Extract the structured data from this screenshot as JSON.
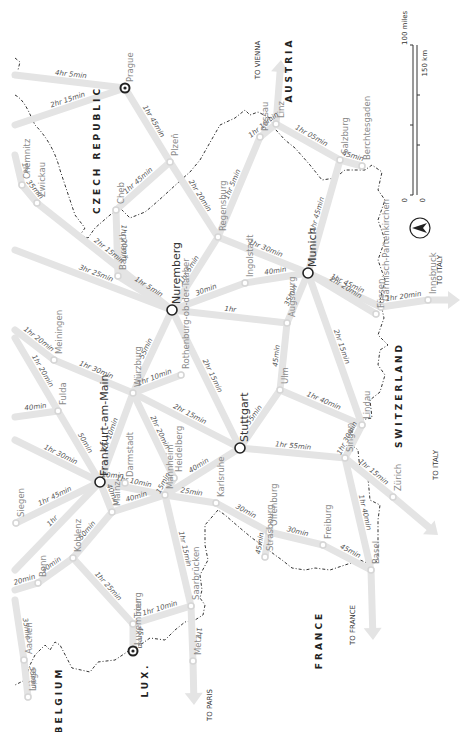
{
  "map": {
    "description": "Rail travel times map of Germany and neighbours (rotated 90°)",
    "countries": [
      {
        "id": "czech",
        "label": "CZECH REPUBLIC",
        "x": 100,
        "y": 150
      },
      {
        "id": "austria",
        "label": "AUSTRIA",
        "x": 292,
        "y": 70
      },
      {
        "id": "switzerland",
        "label": "SWITZERLAND",
        "x": 402,
        "y": 395
      },
      {
        "id": "france",
        "label": "FRANCE",
        "x": 322,
        "y": 640
      },
      {
        "id": "belgium",
        "label": "BELGIUM",
        "x": 62,
        "y": 700
      },
      {
        "id": "lux",
        "label": "LUX.",
        "x": 148,
        "y": 680
      }
    ],
    "directions": [
      {
        "id": "to-vienna",
        "label": "TO VIENNA",
        "x": 260,
        "y": 60
      },
      {
        "id": "to-italy-1",
        "label": "TO ITALY",
        "x": 442,
        "y": 270
      },
      {
        "id": "to-italy-2",
        "label": "TO ITALY",
        "x": 438,
        "y": 465
      },
      {
        "id": "to-france",
        "label": "TO FRANCE",
        "x": 355,
        "y": 625
      },
      {
        "id": "to-paris",
        "label": "TO PARIS",
        "x": 212,
        "y": 705
      }
    ],
    "cities": [
      {
        "id": "prague",
        "label": "Prague",
        "x": 125,
        "y": 88,
        "type": "capital"
      },
      {
        "id": "plzen",
        "label": "Plzeň",
        "x": 170,
        "y": 162,
        "type": "minor"
      },
      {
        "id": "regensburg",
        "label": "Regensburg",
        "x": 218,
        "y": 237,
        "type": "minor"
      },
      {
        "id": "passau",
        "label": "Passau",
        "x": 260,
        "y": 137,
        "type": "minor"
      },
      {
        "id": "linz",
        "label": "Linz",
        "x": 276,
        "y": 124,
        "type": "minor"
      },
      {
        "id": "salzburg",
        "label": "Salzburg",
        "x": 340,
        "y": 160,
        "type": "minor"
      },
      {
        "id": "berchtesgaden",
        "label": "Berchtesgaden",
        "x": 362,
        "y": 166,
        "type": "minor"
      },
      {
        "id": "munich",
        "label": "Munich",
        "x": 308,
        "y": 273,
        "type": "major"
      },
      {
        "id": "ingolstadt",
        "label": "Ingolstadt",
        "x": 245,
        "y": 283,
        "type": "minor"
      },
      {
        "id": "nuremberg",
        "label": "Nuremberg",
        "x": 172,
        "y": 310,
        "type": "major"
      },
      {
        "id": "bayreuth",
        "label": "Bayreuth",
        "x": 118,
        "y": 276,
        "type": "minor"
      },
      {
        "id": "cheb",
        "label": "Cheb",
        "x": 116,
        "y": 210,
        "type": "minor"
      },
      {
        "id": "chemnitz",
        "label": "Chemnitz",
        "x": 22,
        "y": 185,
        "type": "minor"
      },
      {
        "id": "zwickau",
        "label": "Zwickau",
        "x": 37,
        "y": 203,
        "type": "minor"
      },
      {
        "id": "augsburg",
        "label": "Augsburg",
        "x": 287,
        "y": 323,
        "type": "minor"
      },
      {
        "id": "ulm",
        "label": "Ulm",
        "x": 280,
        "y": 390,
        "type": "minor"
      },
      {
        "id": "stuttgart",
        "label": "Stuttgart",
        "x": 240,
        "y": 448,
        "type": "major"
      },
      {
        "id": "rothenburg",
        "label": "Rothenburg-ob-der-Tauber",
        "x": 181,
        "y": 375,
        "type": "minor"
      },
      {
        "id": "wurzburg",
        "label": "Würzburg",
        "x": 133,
        "y": 393,
        "type": "minor"
      },
      {
        "id": "meiningen",
        "label": "Meiningen",
        "x": 54,
        "y": 360,
        "type": "minor"
      },
      {
        "id": "fulda",
        "label": "Fulda",
        "x": 58,
        "y": 411,
        "type": "minor"
      },
      {
        "id": "frankfurt",
        "label": "Frankfurt-am-Main",
        "x": 100,
        "y": 482,
        "type": "major"
      },
      {
        "id": "darmstadt",
        "label": "Darmstadt",
        "x": 125,
        "y": 483,
        "type": "minor"
      },
      {
        "id": "heidelberg",
        "label": "Heidelberg",
        "x": 174,
        "y": 478,
        "type": "minor"
      },
      {
        "id": "mannheim",
        "label": "Mannheim",
        "x": 165,
        "y": 495,
        "type": "minor"
      },
      {
        "id": "karlsruhe",
        "label": "Karlsruhe",
        "x": 216,
        "y": 503,
        "type": "minor"
      },
      {
        "id": "mainz",
        "label": "Mainz",
        "x": 112,
        "y": 512,
        "type": "minor"
      },
      {
        "id": "koblenz",
        "label": "Koblenz",
        "x": 73,
        "y": 558,
        "type": "minor"
      },
      {
        "id": "bonn",
        "label": "Bonn",
        "x": 38,
        "y": 583,
        "type": "minor"
      },
      {
        "id": "siegen",
        "label": "Siegen",
        "x": 16,
        "y": 523,
        "type": "minor"
      },
      {
        "id": "aachen",
        "label": "Aachen",
        "x": 24,
        "y": 660,
        "type": "minor"
      },
      {
        "id": "liege",
        "label": "Liège",
        "x": 28,
        "y": 697,
        "type": "minor"
      },
      {
        "id": "trier",
        "label": "Trier",
        "x": 133,
        "y": 624,
        "type": "minor"
      },
      {
        "id": "luxembourg",
        "label": "Luxembourg",
        "x": 133,
        "y": 651,
        "type": "capital"
      },
      {
        "id": "saarbrucken",
        "label": "Saarbrücken",
        "x": 191,
        "y": 606,
        "type": "minor"
      },
      {
        "id": "metz",
        "label": "Metz",
        "x": 193,
        "y": 661,
        "type": "minor"
      },
      {
        "id": "offenburg",
        "label": "Offenburg",
        "x": 269,
        "y": 532,
        "type": "minor"
      },
      {
        "id": "strasbourg",
        "label": "Strasbourg",
        "x": 265,
        "y": 557,
        "type": "minor"
      },
      {
        "id": "freiburg",
        "label": "Freiburg",
        "x": 323,
        "y": 545,
        "type": "minor"
      },
      {
        "id": "basel",
        "label": "Basel",
        "x": 371,
        "y": 570,
        "type": "minor"
      },
      {
        "id": "singen",
        "label": "Singen",
        "x": 345,
        "y": 458,
        "type": "minor"
      },
      {
        "id": "lindau",
        "label": "Lindau",
        "x": 362,
        "y": 425,
        "type": "minor"
      },
      {
        "id": "zurich",
        "label": "Zürich",
        "x": 393,
        "y": 497,
        "type": "minor"
      },
      {
        "id": "fussen",
        "label": "Füssen",
        "x": 376,
        "y": 314,
        "type": "minor"
      },
      {
        "id": "garmisch",
        "label": "Garmisch-Partenkirchen",
        "x": 381,
        "y": 307,
        "type": "minor"
      },
      {
        "id": "innsbruck",
        "label": "Innsbruck",
        "x": 428,
        "y": 300,
        "type": "minor"
      }
    ],
    "routes": [
      {
        "from": [
          15,
          75
        ],
        "to": "prague",
        "time": "4hr 5min"
      },
      {
        "from": [
          15,
          125
        ],
        "to": "prague",
        "time": "2hr 15min"
      },
      {
        "from": "prague",
        "to": "plzen",
        "time": "1hr 45min"
      },
      {
        "from": "plzen",
        "to": "regensburg",
        "time": "2hr 20min"
      },
      {
        "from": "plzen",
        "to": "cheb",
        "time": "1hr 45min"
      },
      {
        "from": "regensburg",
        "to": "passau",
        "time": "1hr 5min"
      },
      {
        "from": "passau",
        "to": "linz",
        "time": "1hr 10min"
      },
      {
        "from": "linz",
        "to": "salzburg",
        "time": "1hr 05min"
      },
      {
        "from": "salzburg",
        "to": "berchtesgaden",
        "time": "45min"
      },
      {
        "from": "salzburg",
        "to": "munich",
        "time": "1hr 45min"
      },
      {
        "from": "regensburg",
        "to": "nuremberg",
        "time": "1hr 5min"
      },
      {
        "from": "regensburg",
        "to": "munich",
        "time": "1hr 30min"
      },
      {
        "from": "cheb",
        "to": "bayreuth",
        "time": "1hr 20min"
      },
      {
        "from": "bayreuth",
        "to": "nuremberg",
        "time": "1hr 5min"
      },
      {
        "from": [
          15,
          155
        ],
        "to": "chemnitz",
        "time": "1hr"
      },
      {
        "from": "chemnitz",
        "to": "zwickau",
        "time": "35min"
      },
      {
        "from": "zwickau",
        "to": "nuremberg",
        "time": "2hr 15min"
      },
      {
        "from": [
          15,
          250
        ],
        "to": "nuremberg",
        "time": "3hr 25min"
      },
      {
        "from": "nuremberg",
        "to": "ingolstadt",
        "time": "30min"
      },
      {
        "from": "ingolstadt",
        "to": "munich",
        "time": "40min"
      },
      {
        "from": "nuremberg",
        "to": "augsburg",
        "time": "1hr"
      },
      {
        "from": "augsburg",
        "to": "munich",
        "time": "35min"
      },
      {
        "from": "munich",
        "to": "garmisch",
        "time": "1hr 45min"
      },
      {
        "from": "munich",
        "to": "fussen",
        "time": "2hr 20min"
      },
      {
        "from": "garmisch",
        "to": "innsbruck",
        "time": "1hr 20min"
      },
      {
        "from": "munich",
        "to": "lindau",
        "time": "2hr 15min"
      },
      {
        "from": "augsburg",
        "to": "ulm",
        "time": "45min"
      },
      {
        "from": "ulm",
        "to": "stuttgart",
        "time": "55min"
      },
      {
        "from": "ulm",
        "to": "lindau",
        "time": "1hr 40min"
      },
      {
        "from": "nuremberg",
        "to": "wurzburg",
        "time": "55min"
      },
      {
        "from": "nuremberg",
        "to": "stuttgart",
        "time": "2hr 15min"
      },
      {
        "from": "wurzburg",
        "to": "rothenburg",
        "time": "1hr 10min"
      },
      {
        "from": "wurzburg",
        "to": "meiningen",
        "time": "1hr 30min"
      },
      {
        "from": [
          15,
          330
        ],
        "to": "meiningen",
        "time": "1hr 20min"
      },
      {
        "from": [
          15,
          338
        ],
        "to": "fulda",
        "time": "1hr 20min"
      },
      {
        "from": [
          15,
          417
        ],
        "to": "fulda",
        "time": "40min"
      },
      {
        "from": "fulda",
        "to": "frankfurt",
        "time": "50min"
      },
      {
        "from": [
          15,
          440
        ],
        "to": "frankfurt",
        "time": "1hr 30min"
      },
      {
        "from": "wurzburg",
        "to": "frankfurt",
        "time": "1hr 10min"
      },
      {
        "from": "wurzburg",
        "to": "stuttgart",
        "time": "2hr 15min"
      },
      {
        "from": "wurzburg",
        "to": "heidelberg",
        "time": "2hr 20min"
      },
      {
        "from": "frankfurt",
        "to": "mannheim",
        "time": "1hr 10min"
      },
      {
        "from": "frankfurt",
        "to": "darmstadt",
        "time": "20min"
      },
      {
        "from": "frankfurt",
        "to": "mainz",
        "time": "40min"
      },
      {
        "from": "mainz",
        "to": "mannheim",
        "time": "40min"
      },
      {
        "from": "mannheim",
        "to": "heidelberg",
        "time": "15min"
      },
      {
        "from": "mannheim",
        "to": "stuttgart",
        "time": "40min"
      },
      {
        "from": "mannheim",
        "to": "karlsruhe",
        "time": "25min"
      },
      {
        "from": "mannheim",
        "to": "saarbrucken",
        "time": "1hr 15min"
      },
      {
        "from": "karlsruhe",
        "to": "offenburg",
        "time": "30min"
      },
      {
        "from": "stuttgart",
        "to": "singen",
        "time": "1hr 55min"
      },
      {
        "from": "frankfurt",
        "to": "siegen",
        "time": "1hr 45min"
      },
      {
        "from": "frankfurt",
        "to": [
          15,
          570
        ],
        "time": "1hr"
      },
      {
        "from": "mainz",
        "to": "koblenz",
        "time": "50min"
      },
      {
        "from": "koblenz",
        "to": "bonn",
        "time": "30min"
      },
      {
        "from": "bonn",
        "to": [
          15,
          590
        ],
        "time": "20min"
      },
      {
        "from": "koblenz",
        "to": "trier",
        "time": "1hr 25min"
      },
      {
        "from": "trier",
        "to": "luxembourg",
        "time": "45min"
      },
      {
        "from": "trier",
        "to": "saarbrucken",
        "time": "1hr 10min"
      },
      {
        "from": "saarbrucken",
        "to": "metz",
        "time": "1hr"
      },
      {
        "from": [
          15,
          600
        ],
        "to": "aachen",
        "time": "35min"
      },
      {
        "from": "aachen",
        "to": "liege",
        "time": "55min"
      },
      {
        "from": "offenburg",
        "to": "strasbourg",
        "time": "45min"
      },
      {
        "from": "offenburg",
        "to": "freiburg",
        "time": "30min"
      },
      {
        "from": "freiburg",
        "to": "basel",
        "time": "45min"
      },
      {
        "from": "basel",
        "to": "singen",
        "time": "1hr 40min"
      },
      {
        "from": "singen",
        "to": "lindau",
        "time": "1hr 30min"
      },
      {
        "from": "singen",
        "to": "zurich",
        "time": "1hr 15min"
      }
    ],
    "arrows": [
      {
        "id": "vienna-arrow",
        "from": "linz",
        "tip": [
          281,
          60
        ]
      },
      {
        "id": "italy-arrow-1",
        "from": "innsbruck",
        "tip": [
          460,
          300
        ]
      },
      {
        "id": "italy-arrow-2",
        "from": "zurich",
        "tip": [
          438,
          535
        ]
      },
      {
        "id": "france-arrow",
        "from": "basel",
        "tip": [
          373,
          640
        ]
      },
      {
        "id": "paris-arrow",
        "from": "metz",
        "tip": [
          194,
          705
        ]
      }
    ],
    "scale": {
      "miles_label": "100 miles",
      "km_label": "150 km",
      "zero": "0"
    },
    "compass": {
      "label": "N"
    }
  }
}
